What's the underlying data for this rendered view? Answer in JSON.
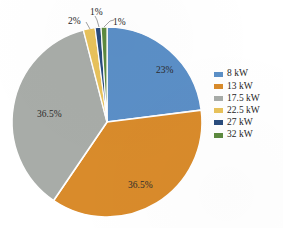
{
  "chart_data": {
    "type": "pie",
    "title": "",
    "categories": [
      "8 kW",
      "13 kW",
      "17.5 kW",
      "22.5 kW",
      "27 kW",
      "32 kW"
    ],
    "values": [
      23,
      36.5,
      36.5,
      2,
      1,
      1
    ],
    "data_labels": [
      "23%",
      "36.5%",
      "36.5%",
      "2%",
      "1%",
      "1%"
    ],
    "colors": [
      "#5B8FC7",
      "#D98B2B",
      "#A8ACA8",
      "#E8C25B",
      "#2A4C7D",
      "#5D8A3F"
    ],
    "legend_position": "right",
    "grid": false,
    "start_angle_deg": 0,
    "direction": "clockwise"
  },
  "legend": {
    "items": [
      {
        "label": "8 kW",
        "color": "#5B8FC7"
      },
      {
        "label": "13 kW",
        "color": "#D98B2B"
      },
      {
        "label": "17.5 kW",
        "color": "#A8ACA8"
      },
      {
        "label": "22.5 kW",
        "color": "#E8C25B"
      },
      {
        "label": "27 kW",
        "color": "#2A4C7D"
      },
      {
        "label": "32 kW",
        "color": "#5D8A3F"
      }
    ]
  },
  "pie_labels": {
    "blue": "23%",
    "orange": "36.5%",
    "gray": "36.5%",
    "gold_callout": "2%",
    "navy_callout": "1%",
    "green_callout": "1%"
  }
}
